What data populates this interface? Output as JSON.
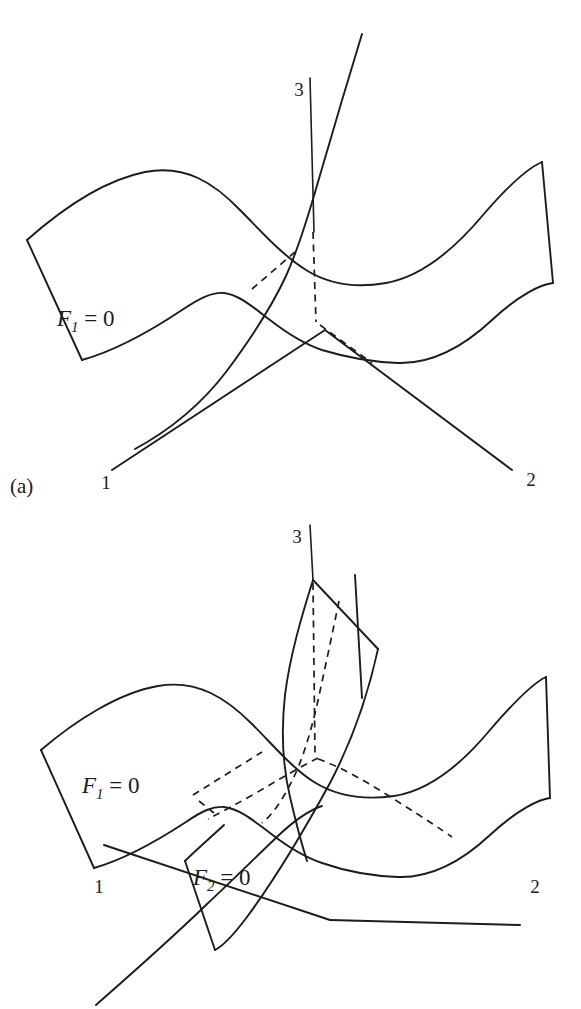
{
  "figure": {
    "type": "line-diagram",
    "background_color": "#ffffff",
    "stroke_color": "#1c1c1c"
  },
  "panels": [
    {
      "id": "a",
      "caption": "(a)",
      "axes": [
        {
          "name": "axis-1",
          "label": "1"
        },
        {
          "name": "axis-2",
          "label": "2"
        },
        {
          "name": "axis-3",
          "label": "3"
        }
      ],
      "surfaces": [
        {
          "name": "surface-f1",
          "label_base": "F",
          "label_sub": "1",
          "label_eq": " = 0"
        }
      ]
    },
    {
      "id": "b",
      "caption": "(b)",
      "axes": [
        {
          "name": "axis-1",
          "label": "1"
        },
        {
          "name": "axis-2",
          "label": "2"
        },
        {
          "name": "axis-3",
          "label": "3"
        }
      ],
      "surfaces": [
        {
          "name": "surface-f1",
          "label_base": "F",
          "label_sub": "1",
          "label_eq": " = 0"
        },
        {
          "name": "surface-f2",
          "label_base": "F",
          "label_sub": "2",
          "label_eq": " = 0"
        }
      ]
    }
  ],
  "labels": {
    "panel_a_caption": "(a)",
    "panel_b_caption": "(b)",
    "axis_1": "1",
    "axis_2": "2",
    "axis_3": "3",
    "f1_base": "F",
    "f1_sub": "1",
    "f1_eq": " = 0",
    "f2_base": "F",
    "f2_sub": "2",
    "f2_eq": " = 0"
  }
}
